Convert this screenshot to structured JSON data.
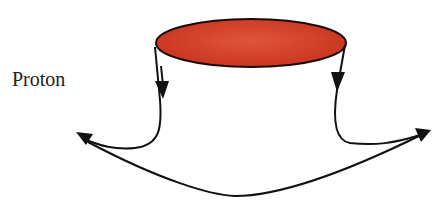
{
  "diagram": {
    "label": "Proton",
    "elements": [
      {
        "id": "disk",
        "shape": "ellipse",
        "fill": "#d8402a",
        "description": "red flat disk (proton rest frame / nucleus surface)"
      },
      {
        "id": "left-flow",
        "description": "arrow down from left edge of disk, curving left to arrowhead"
      },
      {
        "id": "right-flow",
        "description": "arrow down from right edge of disk, curving right to arrowhead"
      },
      {
        "id": "bottom-arc",
        "description": "curved line connecting left and right arrowheads below"
      }
    ],
    "colors": {
      "disk_fill": "#d8402a",
      "disk_dark": "#b82a18",
      "stroke": "#111111"
    }
  }
}
